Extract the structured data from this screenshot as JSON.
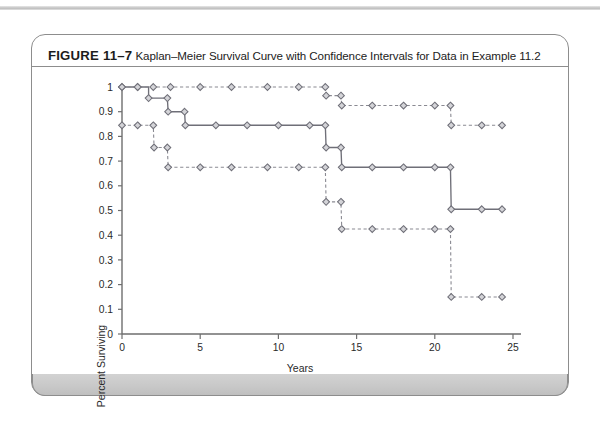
{
  "figure": {
    "label": "FIGURE 11–7",
    "caption": "Kaplan–Meier Survival Curve with Confidence Intervals for Data in Example 11.2"
  },
  "colors": {
    "axis": "#6e6e6e",
    "curve": "#6f6f78",
    "ci": "#8a8a92",
    "marker_fill": "#d4d4d8",
    "marker_stroke": "#6f6f78",
    "frame": "#8d8d8d",
    "footer": "#c9c9c9",
    "text": "#2a2a2a"
  },
  "chart_data": {
    "type": "line",
    "title": "Kaplan–Meier Survival Curve with Confidence Intervals for Data in Example 11.2",
    "xlabel": "Years",
    "ylabel": "Percent Surviving",
    "xlim": [
      0,
      25
    ],
    "ylim": [
      0,
      1
    ],
    "xticks": [
      0,
      5,
      10,
      15,
      20,
      25
    ],
    "xticklabels": [
      "0",
      "5",
      "10",
      "15",
      "20",
      "25"
    ],
    "yticks": [
      0,
      0.1,
      0.2,
      0.3,
      0.4,
      0.5,
      0.6,
      0.7,
      0.8,
      0.9,
      1
    ],
    "yticklabels": [
      "0",
      "0.1",
      "0.2",
      "0.3",
      "0.4",
      "0.5",
      "0.6",
      "0.7",
      "0.8",
      "0.9",
      "1"
    ],
    "grid": false,
    "legend": null,
    "marker": "diamond",
    "series": [
      {
        "name": "Survival estimate",
        "style": "solid",
        "step": "post",
        "points": [
          {
            "x": 0,
            "y": 1.0
          },
          {
            "x": 1.0,
            "y": 1.0
          },
          {
            "x": 1.7,
            "y": 0.955
          },
          {
            "x": 2.9,
            "y": 0.955
          },
          {
            "x": 2.95,
            "y": 0.9
          },
          {
            "x": 4.0,
            "y": 0.9
          },
          {
            "x": 4.05,
            "y": 0.845
          },
          {
            "x": 6.0,
            "y": 0.845
          },
          {
            "x": 8.0,
            "y": 0.845
          },
          {
            "x": 10.0,
            "y": 0.845
          },
          {
            "x": 12.0,
            "y": 0.845
          },
          {
            "x": 13.0,
            "y": 0.845
          },
          {
            "x": 13.05,
            "y": 0.755
          },
          {
            "x": 14.0,
            "y": 0.755
          },
          {
            "x": 14.05,
            "y": 0.675
          },
          {
            "x": 16.0,
            "y": 0.675
          },
          {
            "x": 18.0,
            "y": 0.675
          },
          {
            "x": 20.0,
            "y": 0.675
          },
          {
            "x": 21.0,
            "y": 0.675
          },
          {
            "x": 21.05,
            "y": 0.505
          },
          {
            "x": 23.0,
            "y": 0.505
          },
          {
            "x": 24.3,
            "y": 0.505
          }
        ]
      },
      {
        "name": "Upper confidence limit",
        "style": "dashed",
        "step": "post",
        "points": [
          {
            "x": 0,
            "y": 1.0
          },
          {
            "x": 1.0,
            "y": 1.0
          },
          {
            "x": 2.0,
            "y": 1.0
          },
          {
            "x": 3.1,
            "y": 1.0
          },
          {
            "x": 5.0,
            "y": 1.0
          },
          {
            "x": 7.0,
            "y": 1.0
          },
          {
            "x": 9.3,
            "y": 1.0
          },
          {
            "x": 11.3,
            "y": 1.0
          },
          {
            "x": 13.0,
            "y": 1.0
          },
          {
            "x": 13.05,
            "y": 0.965
          },
          {
            "x": 14.0,
            "y": 0.965
          },
          {
            "x": 14.05,
            "y": 0.925
          },
          {
            "x": 16.0,
            "y": 0.925
          },
          {
            "x": 18.0,
            "y": 0.925
          },
          {
            "x": 20.0,
            "y": 0.925
          },
          {
            "x": 21.0,
            "y": 0.925
          },
          {
            "x": 21.05,
            "y": 0.845
          },
          {
            "x": 23.0,
            "y": 0.845
          },
          {
            "x": 24.3,
            "y": 0.845
          }
        ]
      },
      {
        "name": "Lower confidence limit",
        "style": "dashed",
        "step": "post",
        "points": [
          {
            "x": 0,
            "y": 0.845
          },
          {
            "x": 1.0,
            "y": 0.845
          },
          {
            "x": 2.0,
            "y": 0.845
          },
          {
            "x": 2.05,
            "y": 0.755
          },
          {
            "x": 2.9,
            "y": 0.755
          },
          {
            "x": 2.95,
            "y": 0.675
          },
          {
            "x": 5.0,
            "y": 0.675
          },
          {
            "x": 7.0,
            "y": 0.675
          },
          {
            "x": 9.3,
            "y": 0.675
          },
          {
            "x": 11.3,
            "y": 0.675
          },
          {
            "x": 13.0,
            "y": 0.675
          },
          {
            "x": 13.05,
            "y": 0.535
          },
          {
            "x": 14.0,
            "y": 0.535
          },
          {
            "x": 14.05,
            "y": 0.425
          },
          {
            "x": 16.0,
            "y": 0.425
          },
          {
            "x": 18.0,
            "y": 0.425
          },
          {
            "x": 20.0,
            "y": 0.425
          },
          {
            "x": 21.0,
            "y": 0.425
          },
          {
            "x": 21.05,
            "y": 0.15
          },
          {
            "x": 23.0,
            "y": 0.15
          },
          {
            "x": 24.3,
            "y": 0.15
          }
        ]
      }
    ]
  }
}
